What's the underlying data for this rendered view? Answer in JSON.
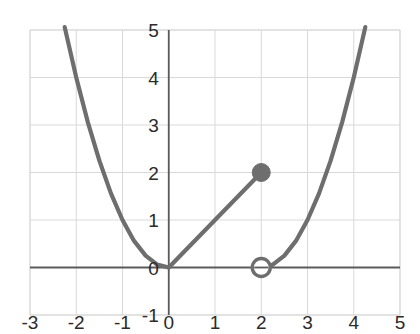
{
  "chart_data": {
    "type": "line",
    "title": "",
    "xlabel": "",
    "ylabel": "",
    "xlim": [
      -3,
      5
    ],
    "ylim": [
      -1,
      5
    ],
    "grid": true,
    "legend": "none",
    "xticks": [
      "-3",
      "-2",
      "-1",
      "0",
      "1",
      "2",
      "3",
      "4",
      "5"
    ],
    "xtick_values": [
      -3,
      -2,
      -1,
      0,
      1,
      2,
      3,
      4,
      5
    ],
    "yticks": [
      "-1",
      "0",
      "1",
      "2",
      "3",
      "4",
      "5"
    ],
    "ytick_values": [
      -1,
      0,
      1,
      2,
      3,
      4,
      5
    ],
    "series": [
      {
        "name": "left-branch-parabola",
        "equation": "y = x^2",
        "domain": [
          -2.25,
          0
        ],
        "style": "solid",
        "color": "#6e6e6e",
        "points": [
          {
            "x": -2.25,
            "y": 5.06
          },
          {
            "x": -2.0,
            "y": 4.0
          },
          {
            "x": -1.75,
            "y": 3.06
          },
          {
            "x": -1.5,
            "y": 2.25
          },
          {
            "x": -1.25,
            "y": 1.56
          },
          {
            "x": -1.0,
            "y": 1.0
          },
          {
            "x": -0.75,
            "y": 0.56
          },
          {
            "x": -0.5,
            "y": 0.25
          },
          {
            "x": -0.25,
            "y": 0.06
          },
          {
            "x": 0,
            "y": 0
          }
        ]
      },
      {
        "name": "middle-line-segment",
        "equation": "y = x",
        "domain": [
          0,
          2
        ],
        "style": "solid",
        "color": "#6e6e6e",
        "points": [
          {
            "x": 0,
            "y": 0
          },
          {
            "x": 2,
            "y": 2
          }
        ]
      },
      {
        "name": "right-branch-parabola",
        "equation": "y = (x - 2)^2",
        "domain": [
          2,
          4.25
        ],
        "style": "solid",
        "color": "#6e6e6e",
        "points": [
          {
            "x": 2.0,
            "y": 0
          },
          {
            "x": 2.25,
            "y": 0.06
          },
          {
            "x": 2.5,
            "y": 0.25
          },
          {
            "x": 2.75,
            "y": 0.56
          },
          {
            "x": 3.0,
            "y": 1.0
          },
          {
            "x": 3.25,
            "y": 1.56
          },
          {
            "x": 3.5,
            "y": 2.25
          },
          {
            "x": 3.75,
            "y": 3.06
          },
          {
            "x": 4.0,
            "y": 4.0
          },
          {
            "x": 4.25,
            "y": 5.06
          }
        ]
      }
    ],
    "markers": [
      {
        "name": "closed-point",
        "kind": "filled-circle",
        "x": 2,
        "y": 2,
        "label": "(2, 2)",
        "color": "#6e6e6e",
        "radius": 9
      },
      {
        "name": "open-point",
        "kind": "open-circle",
        "x": 2,
        "y": 0,
        "label": "(2, 0)",
        "color": "#6e6e6e",
        "radius": 9
      }
    ],
    "axes": {
      "x_axis_at_y": 0,
      "y_axis_at_x": 0,
      "axis_color": "#5a5a5a",
      "grid_color": "#d9d9d9"
    }
  },
  "colors": {
    "curve": "#6e6e6e",
    "axis": "#5a5a5a",
    "grid": "#d9d9d9",
    "text": "#2b2b2b",
    "background": "#ffffff"
  }
}
